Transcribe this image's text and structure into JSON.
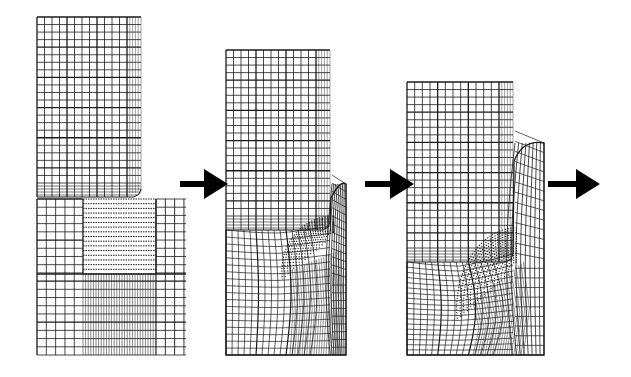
{
  "figure": {
    "title": "Finite element mesh deformation sequence (punch indentation / shearing)",
    "background": "#ffffff",
    "line_color": "#1a1a1a",
    "arrow_color": "#000000",
    "stages": [
      {
        "id": "stage-1",
        "label": "Initial mesh",
        "punch": {
          "x": 37,
          "y": 17,
          "w": 104,
          "h": 180,
          "cols": 12,
          "rows": 22,
          "fine_cols_right": 4
        },
        "workpiece": {
          "x": 37,
          "y": 199,
          "w": 149,
          "h": 156,
          "cols": 16,
          "rows": 19
        },
        "fine_zone": {
          "x": 83,
          "y": 199,
          "w": 73,
          "h": 75,
          "rows": 16
        }
      },
      {
        "id": "stage-2",
        "label": "Intermediate deformation",
        "punch": {
          "x": 226,
          "y": 50,
          "w": 104,
          "h": 180,
          "cols": 12,
          "rows": 22
        },
        "workpiece": {
          "x": 226,
          "y": 184,
          "w": 120,
          "h": 171
        },
        "deformation": 1
      },
      {
        "id": "stage-3",
        "label": "Advanced deformation",
        "punch": {
          "x": 407,
          "y": 82,
          "w": 106,
          "h": 180,
          "cols": 12,
          "rows": 22
        },
        "workpiece": {
          "x": 407,
          "y": 143,
          "w": 137,
          "h": 212
        },
        "deformation": 2
      }
    ],
    "arrows": [
      {
        "id": "arrow-1",
        "x1": 180,
        "x2": 228,
        "y": 184
      },
      {
        "id": "arrow-2",
        "x1": 365,
        "x2": 414,
        "y": 184
      },
      {
        "id": "arrow-3",
        "x1": 548,
        "x2": 600,
        "y": 184
      }
    ]
  }
}
